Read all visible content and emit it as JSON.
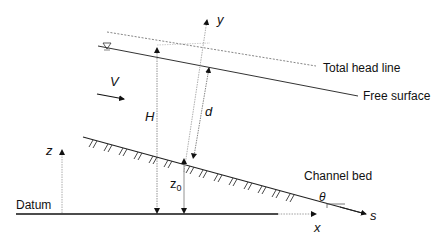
{
  "diagram": {
    "labels": {
      "total_head_line": "Total head line",
      "free_surface": "Free surface",
      "channel_bed": "Channel bed",
      "datum": "Datum",
      "velocity": "V",
      "total_head": "H",
      "depth": "d",
      "y_axis": "y",
      "z_axis": "z",
      "z0_base": "z",
      "z0_sub": "0",
      "x_axis": "x",
      "s_axis": "s",
      "angle": "θ"
    },
    "colors": {
      "line": "#1a1a1a",
      "dotted": "#888888",
      "background": "#ffffff"
    }
  }
}
